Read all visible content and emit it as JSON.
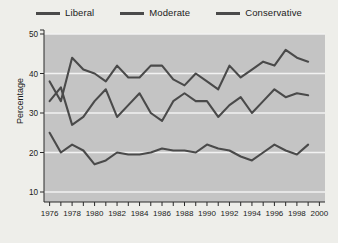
{
  "legend": {
    "position": "top-center",
    "items": [
      {
        "label": "Liberal",
        "color": "#4a4a4a"
      },
      {
        "label": "Moderate",
        "color": "#4a4a4a"
      },
      {
        "label": "Conservative",
        "color": "#4a4a4a"
      }
    ]
  },
  "axes": {
    "ylabel": "Percentage",
    "yticks": [
      10,
      20,
      30,
      40,
      50
    ],
    "ylim": [
      5,
      50
    ],
    "xlim": [
      1975.5,
      2000.5
    ],
    "xticks": [
      1976,
      1977,
      1978,
      1979,
      1980,
      1981,
      1982,
      1983,
      1984,
      1985,
      1986,
      1987,
      1988,
      1989,
      1990,
      1991,
      1992,
      1993,
      1994,
      1995,
      1996,
      1997,
      1998,
      1999,
      2000
    ],
    "xticklabels": [
      "1976",
      "",
      "1978",
      "",
      "1980",
      "",
      "1982",
      "",
      "1984",
      "",
      "1986",
      "",
      "1988",
      "",
      "1990",
      "",
      "1992",
      "",
      "1994",
      "",
      "1996",
      "",
      "1998",
      "",
      "2000"
    ],
    "plot_background": "#c4c4c4",
    "gridline_color": "#f2f2f2"
  },
  "chart_data": {
    "type": "line",
    "title": "",
    "xlabel": "",
    "ylabel": "Percentage",
    "ylim": [
      5,
      50
    ],
    "xlim": [
      1975.5,
      2000.5
    ],
    "grid": "horizontal",
    "legend_position": "top-center",
    "x": [
      1976,
      1977,
      1978,
      1979,
      1980,
      1981,
      1982,
      1983,
      1984,
      1985,
      1986,
      1987,
      1988,
      1989,
      1990,
      1991,
      1992,
      1993,
      1994,
      1995,
      1996,
      1997,
      1998,
      1999
    ],
    "series": [
      {
        "name": "Liberal",
        "color": "#4a4a4a",
        "values": [
          25,
          20,
          22,
          20.5,
          17,
          18,
          20,
          19.5,
          19.5,
          20,
          21,
          20.5,
          20.5,
          20,
          22,
          21,
          20.5,
          19,
          18,
          20,
          22,
          20.5,
          19.5,
          22
        ]
      },
      {
        "name": "Moderate",
        "color": "#4a4a4a",
        "values": [
          38,
          33,
          44,
          41,
          40,
          38,
          42,
          39,
          39,
          42,
          42,
          38.5,
          37,
          40,
          38,
          36,
          42,
          39,
          41,
          43,
          42,
          46,
          44,
          43
        ]
      },
      {
        "name": "Conservative",
        "color": "#4a4a4a",
        "values": [
          33,
          36.5,
          27,
          29,
          33,
          36,
          29,
          32,
          35,
          30,
          28,
          33,
          35,
          33,
          33,
          29,
          32,
          34,
          30,
          33,
          36,
          34,
          35,
          34.5
        ]
      }
    ]
  }
}
